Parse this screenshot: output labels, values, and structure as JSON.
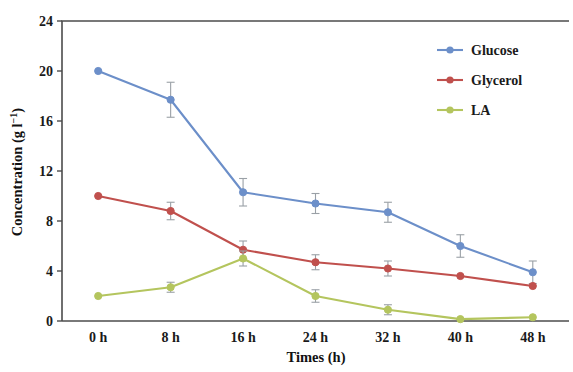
{
  "chart_data": {
    "type": "line",
    "title": "",
    "xlabel": "Times (h)",
    "ylabel": "Concentration (g l⁻¹)",
    "categories": [
      "0 h",
      "8 h",
      "16 h",
      "24 h",
      "32 h",
      "40 h",
      "48 h"
    ],
    "x_values": [
      0,
      8,
      16,
      24,
      32,
      40,
      48
    ],
    "ylim": [
      0,
      24
    ],
    "yticks": [
      0,
      4,
      8,
      12,
      16,
      20,
      24
    ],
    "ytick_labels": [
      "0",
      "4",
      "8",
      "12",
      "16",
      "20",
      "24"
    ],
    "grid": false,
    "legend_position": "top-right",
    "series": [
      {
        "name": "Glucose",
        "color": "#6c8fc9",
        "marker": "circle",
        "values": [
          20.0,
          17.7,
          10.3,
          9.4,
          8.7,
          6.0,
          3.9
        ],
        "errors": [
          0.0,
          1.4,
          1.1,
          0.8,
          0.8,
          0.9,
          0.9
        ]
      },
      {
        "name": "Glycerol",
        "color": "#c0504d",
        "marker": "circle",
        "values": [
          10.0,
          8.8,
          5.7,
          4.7,
          4.2,
          3.6,
          2.8
        ],
        "errors": [
          0.0,
          0.7,
          0.7,
          0.6,
          0.6,
          0.0,
          0.0
        ]
      },
      {
        "name": "LA",
        "color": "#b4c55e",
        "marker": "circle",
        "values": [
          2.0,
          2.7,
          5.0,
          2.0,
          0.9,
          0.15,
          0.3
        ],
        "errors": [
          0.0,
          0.4,
          0.6,
          0.5,
          0.4,
          0.0,
          0.0
        ]
      }
    ]
  },
  "axes": {
    "y_axis_title": "Concentration (g l⁻¹)",
    "x_axis_title": "Times (h)"
  },
  "legend": {
    "items": [
      {
        "label": "Glucose",
        "color": "#6c8fc9"
      },
      {
        "label": "Glycerol",
        "color": "#c0504d"
      },
      {
        "label": "LA",
        "color": "#b4c55e"
      }
    ]
  }
}
